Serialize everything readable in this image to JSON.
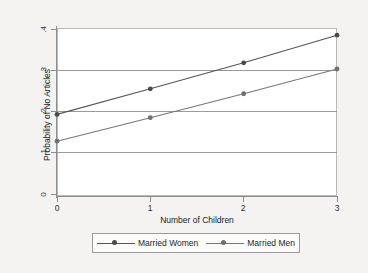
{
  "chart_data": {
    "type": "line",
    "title": "",
    "xlabel": "Number of Children",
    "ylabel": "Probability of No Articles",
    "x": [
      0,
      1,
      2,
      3
    ],
    "xticklabels": [
      "0",
      "1",
      "2",
      "3"
    ],
    "yticklabels": [
      "0",
      ".1",
      ".2",
      ".3",
      ".4"
    ],
    "ytickvalues": [
      0,
      0.1,
      0.2,
      0.3,
      0.4
    ],
    "xlim": [
      0,
      3
    ],
    "ylim": [
      0,
      0.4
    ],
    "grid": "horizontal",
    "legend_position": "bottom-outside",
    "series": [
      {
        "name": "Married Women",
        "values": [
          0.193,
          0.255,
          0.318,
          0.385
        ],
        "color": "#555555",
        "marker": "circle"
      },
      {
        "name": "Married Men",
        "values": [
          0.128,
          0.185,
          0.243,
          0.303
        ],
        "color": "#777777",
        "marker": "circle"
      }
    ]
  },
  "axes": {
    "y_title": "Probability of No Articles",
    "x_title": "Number of Children",
    "y_ticks": [
      {
        "label": ".4",
        "value": 0.4
      },
      {
        "label": ".3",
        "value": 0.3
      },
      {
        "label": ".2",
        "value": 0.2
      },
      {
        "label": ".1",
        "value": 0.1
      },
      {
        "label": "0",
        "value": 0
      }
    ],
    "x_ticks": [
      {
        "label": "0",
        "value": 0
      },
      {
        "label": "1",
        "value": 1
      },
      {
        "label": "2",
        "value": 2
      },
      {
        "label": "3",
        "value": 3
      }
    ]
  },
  "legend": {
    "entries": [
      {
        "label": "Married Women",
        "color": "#555555"
      },
      {
        "label": "Married Men",
        "color": "#777777"
      }
    ]
  },
  "colors": {
    "background": "#f4f3f1",
    "plot_background": "#ffffff",
    "axis": "#8c8c8c",
    "gridline": "#9a9a9a",
    "series_women": "#555555",
    "series_men": "#777777"
  }
}
